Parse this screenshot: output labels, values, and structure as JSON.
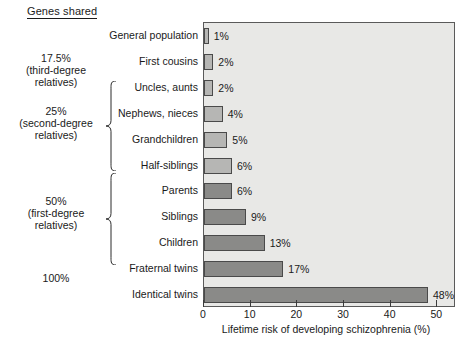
{
  "title": "Genes shared",
  "chart_data": {
    "type": "bar",
    "orientation": "horizontal",
    "title": "Genes shared",
    "xlabel": "Lifetime risk of developing schizophrenia (%)",
    "ylabel": "",
    "xlim": [
      0,
      54
    ],
    "xticks": [
      0,
      10,
      20,
      30,
      40,
      50
    ],
    "xtick_labels": [
      "0",
      "10",
      "20",
      "30",
      "40",
      "50"
    ],
    "grid": false,
    "legend": "none",
    "categories": [
      "General population",
      "First cousins",
      "Uncles, aunts",
      "Nephews, nieces",
      "Grandchildren",
      "Half-siblings",
      "Parents",
      "Siblings",
      "Children",
      "Fraternal twins",
      "Identical twins"
    ],
    "values": [
      1,
      2,
      2,
      4,
      5,
      6,
      6,
      9,
      13,
      17,
      48
    ],
    "value_labels": [
      "1%",
      "2%",
      "2%",
      "4%",
      "5%",
      "6%",
      "6%",
      "9%",
      "13%",
      "17%",
      "48%"
    ],
    "bar_shades": [
      "light",
      "light",
      "light",
      "light",
      "light",
      "light",
      "dark",
      "dark",
      "dark",
      "dark",
      "dark"
    ],
    "annotations": [
      {
        "text": "17.5%\n(third-degree\nrelatives)",
        "relates_to": [
          "First cousins"
        ]
      },
      {
        "text": "25%\n(second-degree\nrelatives)",
        "relates_to": [
          "Uncles, aunts",
          "Nephews, nieces",
          "Grandchildren",
          "Half-siblings"
        ]
      },
      {
        "text": "50%\n(first-degree\nrelatives)",
        "relates_to": [
          "Parents",
          "Siblings",
          "Children",
          "Fraternal twins"
        ]
      },
      {
        "text": "100%",
        "relates_to": [
          "Identical twins"
        ]
      }
    ]
  },
  "groups": [
    {
      "percent": "17.5%",
      "line2": "(third-degree",
      "line3": "relatives)"
    },
    {
      "percent": "25%",
      "line2": "(second-degree",
      "line3": "relatives)"
    },
    {
      "percent": "50%",
      "line2": "(first-degree",
      "line3": "relatives)"
    },
    {
      "percent": "100%",
      "line2": "",
      "line3": ""
    }
  ],
  "colors": {
    "plot_background": "#e8e8e6",
    "bar_light": "#b6b6b4",
    "bar_dark": "#8a8a88",
    "bar_outline": "#4a4a4a",
    "text": "#1a1a1a"
  }
}
